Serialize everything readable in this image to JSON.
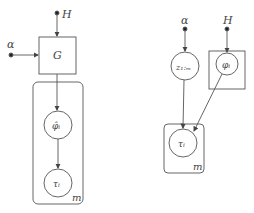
{
  "left_model": {
    "inputs": [
      {
        "label": "H",
        "x": 57,
        "y": 13
      },
      {
        "label": "α",
        "x": 11,
        "y": 55
      }
    ],
    "box_node": {
      "label": "G"
    },
    "nodes": [
      {
        "label": "φ̂ᵢ"
      },
      {
        "label": "τᵢ"
      }
    ],
    "plate_label": "m"
  },
  "right_model": {
    "inputs": [
      {
        "label": "α"
      },
      {
        "label": "H"
      }
    ],
    "nodes": [
      {
        "label": "z₁:ₘ"
      },
      {
        "label": "φᵢ"
      },
      {
        "label": "τᵢ"
      }
    ],
    "plate_label": "m"
  },
  "colors": {
    "stroke": "#555555",
    "background": "#ffffff"
  }
}
